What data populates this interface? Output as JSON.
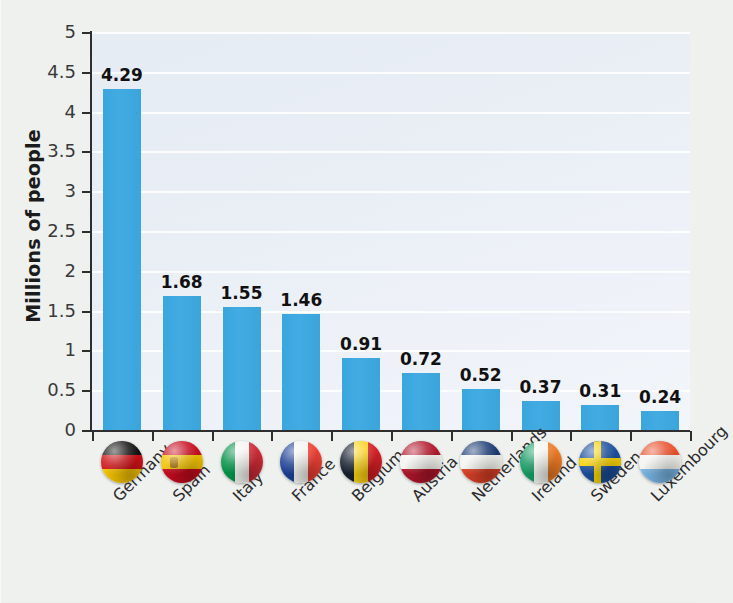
{
  "chart_data": {
    "type": "bar",
    "title": "",
    "xlabel": "",
    "ylabel": "Millions of people",
    "ylim": [
      0,
      5
    ],
    "ytick_step": 0.5,
    "grid": true,
    "legend": "none",
    "bar_color": "#3ba9e0",
    "categories": [
      "Germany",
      "Spain",
      "Italy",
      "France",
      "Belgium",
      "Austria",
      "Netherlands",
      "Ireland",
      "Sweden",
      "Luxembourg"
    ],
    "values": [
      4.29,
      1.68,
      1.55,
      1.46,
      0.91,
      0.72,
      0.52,
      0.37,
      0.31,
      0.24
    ],
    "value_labels": [
      "4.29",
      "1.68",
      "1.55",
      "1.46",
      "0.91",
      "0.72",
      "0.52",
      "0.37",
      "0.31",
      "0.24"
    ],
    "ytick_labels": [
      "5",
      "4.5",
      "4",
      "3.5",
      "3",
      "2.5",
      "2",
      "1.5",
      "1",
      "0.5",
      "0"
    ],
    "ytick_values": [
      5,
      4.5,
      4,
      3.5,
      3,
      2.5,
      2,
      1.5,
      1,
      0.5,
      0
    ],
    "category_icons": [
      "flag-germany-icon",
      "flag-spain-icon",
      "flag-italy-icon",
      "flag-france-icon",
      "flag-belgium-icon",
      "flag-austria-icon",
      "flag-netherlands-icon",
      "flag-ireland-icon",
      "flag-sweden-icon",
      "flag-luxembourg-icon"
    ]
  },
  "colors": {
    "bar": "#3ba9e0",
    "plot_background": "#e9eef5",
    "gridline": "#ffffff",
    "axis": "#2e2e2e",
    "page_background": "#eff1ef",
    "label_text": "#1b1b1b"
  }
}
